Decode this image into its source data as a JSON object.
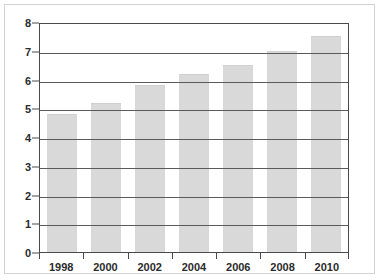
{
  "chart_data": {
    "type": "bar",
    "title": "",
    "subtitle": "",
    "xlabel": "",
    "ylabel": "",
    "categories": [
      "1998",
      "2000",
      "2002",
      "2004",
      "2006",
      "2008",
      "2010"
    ],
    "values": [
      4.8,
      5.2,
      5.8,
      6.2,
      6.5,
      7.0,
      7.5
    ],
    "ylim": [
      0,
      8
    ],
    "ytick_labels": [
      "0",
      "1",
      "2",
      "3",
      "4",
      "5",
      "6",
      "7",
      "8"
    ],
    "ytick_values": [
      0,
      1,
      2,
      3,
      4,
      5,
      6,
      7,
      8
    ],
    "grid": "horizontal",
    "legend": "none",
    "bar_color": "#d9d9d9",
    "axis_color": "#4a4a4a",
    "gridline_color": "#5a5a5a",
    "text_color": "#2b2b2b",
    "frame_color": "#d2d2d2",
    "background_color": "#ffffff"
  }
}
